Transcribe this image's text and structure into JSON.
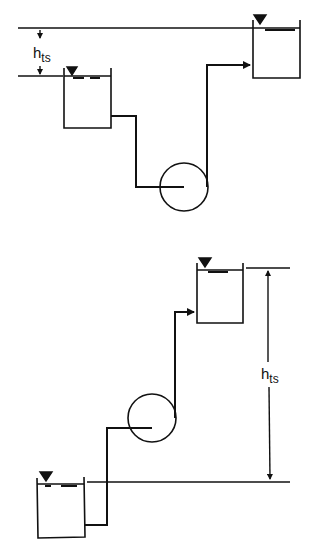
{
  "diagrams": [
    {
      "name": "suction-lift-configuration",
      "label": "h",
      "label_sub": "ts",
      "description": "Supply tank below discharge tank, pump below both; static head measured between surfaces"
    },
    {
      "name": "suction-head-configuration",
      "label": "h",
      "label_sub": "ts",
      "description": "Supply tank below pump; discharge tank above; total static head measured between surfaces"
    }
  ],
  "colors": {
    "line": "#111111",
    "background": "#ffffff"
  }
}
